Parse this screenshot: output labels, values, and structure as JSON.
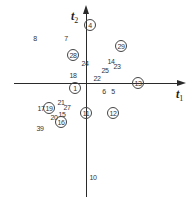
{
  "axes": {
    "x_label": "t",
    "x_sub": "1",
    "y_label": "t",
    "y_sub": "2"
  },
  "points": [
    {
      "label": "4",
      "x": 90,
      "y": 25,
      "circled": true
    },
    {
      "label": "8",
      "x": 35,
      "y": 38,
      "circled": false
    },
    {
      "label": "7",
      "x": 66,
      "y": 38,
      "circled": false
    },
    {
      "label": "29",
      "x": 121,
      "y": 46,
      "circled": true
    },
    {
      "label": "28",
      "x": 73,
      "y": 55,
      "circled": true
    },
    {
      "label": "24",
      "x": 85,
      "y": 63,
      "circled": false
    },
    {
      "label": "14",
      "x": 111,
      "y": 61,
      "circled": false
    },
    {
      "label": "23",
      "x": 117,
      "y": 66,
      "circled": false
    },
    {
      "label": "25",
      "x": 105,
      "y": 70,
      "circled": false
    },
    {
      "label": "18",
      "x": 73,
      "y": 75,
      "circled": false
    },
    {
      "label": "22",
      "x": 97,
      "y": 78,
      "circled": false
    },
    {
      "label": "13",
      "x": 138,
      "y": 83,
      "circled": true
    },
    {
      "label": "1",
      "x": 75,
      "y": 88,
      "circled": true
    },
    {
      "label": "6",
      "x": 104,
      "y": 91,
      "circled": false
    },
    {
      "label": "5",
      "x": 113,
      "y": 91,
      "circled": false
    },
    {
      "label": "21",
      "x": 61,
      "y": 102,
      "circled": false
    },
    {
      "label": "27",
      "x": 67,
      "y": 107,
      "circled": false
    },
    {
      "label": "17",
      "x": 41,
      "y": 108,
      "circled": false
    },
    {
      "label": "19",
      "x": 49,
      "y": 108,
      "circled": true
    },
    {
      "label": "11",
      "x": 86,
      "y": 113,
      "circled": true
    },
    {
      "label": "12",
      "x": 113,
      "y": 113,
      "circled": true
    },
    {
      "label": "15",
      "x": 62,
      "y": 114,
      "circled": false
    },
    {
      "label": "20",
      "x": 54,
      "y": 117,
      "circled": false
    },
    {
      "label": "16",
      "x": 61,
      "y": 122,
      "circled": true
    },
    {
      "label": "39",
      "x": 40,
      "y": 128,
      "circled": false
    },
    {
      "label": "10",
      "x": 93,
      "y": 177,
      "circled": false
    }
  ]
}
